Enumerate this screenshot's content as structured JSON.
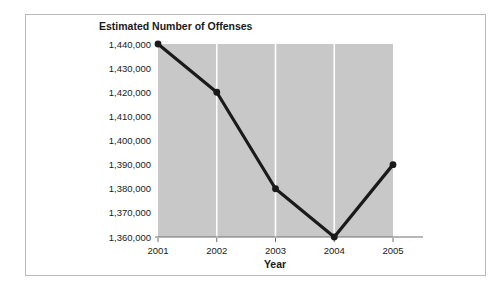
{
  "chart_data": {
    "type": "line",
    "title": "Estimated Number of Offenses",
    "xlabel": "Year",
    "ylabel": "",
    "categories": [
      "2001",
      "2002",
      "2003",
      "2004",
      "2005"
    ],
    "values": [
      1440000,
      1420000,
      1380000,
      1360000,
      1390000
    ],
    "x": [
      2001,
      2002,
      2003,
      2004,
      2005
    ],
    "ylim": [
      1360000,
      1440000
    ],
    "yticks": [
      1360000,
      1370000,
      1380000,
      1390000,
      1400000,
      1410000,
      1420000,
      1430000,
      1440000
    ],
    "ytick_labels": [
      "1,360,000",
      "1,370,000",
      "1,380,000",
      "1,390,000",
      "1,400,000",
      "1,410,000",
      "1,420,000",
      "1,430,000",
      "1,440,000"
    ],
    "xtick_labels": [
      "2001",
      "2002",
      "2003",
      "2004",
      "2005"
    ],
    "grid": {
      "vertical": true,
      "horizontal": false,
      "color": "#ffffff"
    },
    "legend": null,
    "series_color": "#1a1a1a",
    "marker": "circle",
    "plot_background": "#c8c8c8",
    "figure_background": "#ffffff",
    "border_color": "#b9b9b9"
  }
}
